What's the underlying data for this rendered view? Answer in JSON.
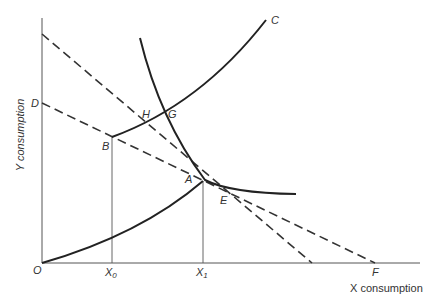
{
  "diagram": {
    "axes": {
      "x_label": "X consumption",
      "y_label": "Y consumption",
      "origin_label": "O"
    },
    "point_labels": {
      "A": "A",
      "B": "B",
      "C": "C",
      "D": "D",
      "E": "E",
      "F": "F",
      "G": "G",
      "H": "H"
    },
    "tick_labels": {
      "x0": "X",
      "x0_sub": "0",
      "x1": "X",
      "x1_sub": "1"
    },
    "colors": {
      "ink": "#222222",
      "background": "#ffffff"
    }
  }
}
